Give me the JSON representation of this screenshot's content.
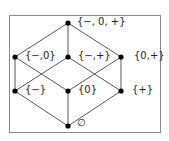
{
  "diagram": {
    "type": "hasse-diagram",
    "nodes": [
      {
        "id": "top",
        "label": "{−, 0, +}",
        "x": 68,
        "y": 23,
        "lx": 77,
        "ly": 16
      },
      {
        "id": "m0",
        "label": "{−,0}",
        "x": 15,
        "y": 57,
        "lx": 25,
        "ly": 50
      },
      {
        "id": "mp",
        "label": "{−,+}",
        "x": 68,
        "y": 57,
        "lx": 78,
        "ly": 50
      },
      {
        "id": "zp",
        "label": "{0,+}",
        "x": 121,
        "y": 57,
        "lx": 134,
        "ly": 50
      },
      {
        "id": "m",
        "label": "{−}",
        "x": 15,
        "y": 91,
        "lx": 25,
        "ly": 84
      },
      {
        "id": "z",
        "label": "{0}",
        "x": 68,
        "y": 91,
        "lx": 78,
        "ly": 84
      },
      {
        "id": "p",
        "label": "{+}",
        "x": 121,
        "y": 91,
        "lx": 132,
        "ly": 84
      },
      {
        "id": "bot",
        "label": "∅",
        "x": 68,
        "y": 126,
        "lx": 77,
        "ly": 117
      }
    ],
    "edges": [
      [
        "top",
        "m0"
      ],
      [
        "top",
        "mp"
      ],
      [
        "top",
        "zp"
      ],
      [
        "m0",
        "m"
      ],
      [
        "m0",
        "z"
      ],
      [
        "mp",
        "m"
      ],
      [
        "mp",
        "p"
      ],
      [
        "zp",
        "z"
      ],
      [
        "zp",
        "p"
      ],
      [
        "m",
        "bot"
      ],
      [
        "z",
        "bot"
      ],
      [
        "p",
        "bot"
      ]
    ],
    "colors": {
      "edge": "#555555",
      "node": "#000000",
      "frame": "#8a8a8a"
    }
  }
}
